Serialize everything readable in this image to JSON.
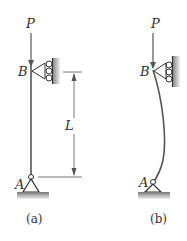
{
  "figure_a": {
    "load_label": "P",
    "top_support_label": "B",
    "bottom_support_label": "A",
    "length_label": "L",
    "caption": "(a)"
  },
  "figure_b": {
    "load_label": "P",
    "top_support_label": "B",
    "bottom_support_label": "A",
    "caption": "(b)"
  },
  "colors": {
    "line": "#555555",
    "text": "#333333",
    "ground_dark": "#777777",
    "ground_light": "#dddddd"
  }
}
